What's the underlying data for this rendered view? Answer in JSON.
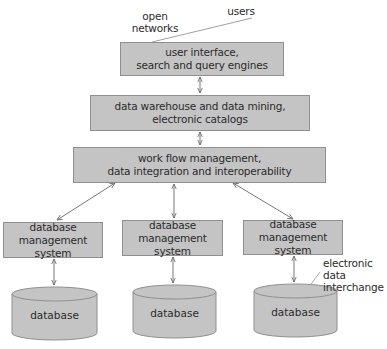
{
  "diagram": {
    "annotations": {
      "open_networks_line1": "open",
      "open_networks_line2": "networks",
      "users": "users",
      "edi_line1": "electronic data",
      "edi_line2": "interchange"
    },
    "layers": [
      {
        "line1": "user interface,",
        "line2": "search and query engines"
      },
      {
        "line1": "data warehouse and data mining,",
        "line2": "electronic catalogs"
      },
      {
        "line1": "work flow management,",
        "line2": "data integration and interoperability"
      }
    ],
    "dbms": [
      {
        "line1": "database management",
        "line2": "system"
      },
      {
        "line1": "database management",
        "line2": "system"
      },
      {
        "line1": "database management",
        "line2": "system"
      }
    ],
    "databases": [
      {
        "label": "database"
      },
      {
        "label": "database"
      },
      {
        "label": "database"
      }
    ],
    "colors": {
      "box_fill": "#c4c4c4",
      "box_border": "#8f8f8f",
      "line": "#777777",
      "text": "#2b2b2b"
    }
  }
}
